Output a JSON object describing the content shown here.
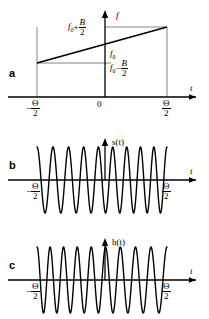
{
  "figure": {
    "panels": [
      {
        "letter": "a",
        "quantity": "frequency-vs-time",
        "y_axis_label": "f",
        "x_axis_label": "t",
        "y_tick_labels": [
          "f₀+B/2",
          "f₀",
          "f₀−B/2"
        ],
        "x_tick_labels": [
          "−Θ/2",
          "0",
          "Θ/2"
        ]
      },
      {
        "letter": "b",
        "quantity": "signal-waveform",
        "y_axis_label": "s(t)",
        "x_axis_label": "t",
        "x_tick_labels": [
          "−Θ/2",
          "Θ/2"
        ]
      },
      {
        "letter": "c",
        "quantity": "impulse-response-waveform",
        "y_axis_label": "h(t)",
        "x_axis_label": "t",
        "x_tick_labels": [
          "−Θ/2",
          "Θ/2"
        ]
      }
    ],
    "symbols": {
      "f0": "f",
      "f0_sub": "0",
      "B": "B",
      "two": "2",
      "theta": "Θ",
      "minus": "−",
      "plus": "+",
      "zero": "0",
      "t": "t",
      "f": "f",
      "s_of_t": "s(t)",
      "h_of_t": "h(t)"
    },
    "colors": {
      "ink": "#000000",
      "guide": "#555555",
      "background": "#ffffff"
    }
  },
  "chart_data": [
    {
      "type": "line",
      "panel": "a",
      "title": "",
      "xlabel": "t",
      "ylabel": "f",
      "xlim": [
        -0.5,
        0.5
      ],
      "ylim": [
        0,
        1
      ],
      "grid": false,
      "legend": "none",
      "x_ticks": [
        -0.5,
        0,
        0.5
      ],
      "x_tick_labels": [
        "−Θ/2",
        "0",
        "Θ/2"
      ],
      "y_ticks": [
        0.28,
        0.5,
        0.72
      ],
      "y_tick_labels": [
        "f₀−B/2",
        "f₀",
        "f₀+B/2"
      ],
      "series": [
        {
          "name": "instantaneous frequency",
          "x": [
            -0.5,
            0.5
          ],
          "values": [
            0.28,
            0.72
          ],
          "description": "linear frequency ramp (chirp) from f0-B/2 to f0+B/2 over duration Theta"
        }
      ],
      "annotations": [
        "vertical guide line at t = -Θ/2",
        "vertical guide line at t = +Θ/2",
        "horizontal guide from f₀+B/2 to the curve at t=+Θ/2",
        "horizontal guide from f₀−B/2 to the curve at t=−Θ/2"
      ]
    },
    {
      "type": "line",
      "panel": "b",
      "title": "",
      "xlabel": "t",
      "ylabel": "s(t)",
      "xlim": [
        -0.5,
        0.5
      ],
      "ylim": [
        -1.15,
        1.15
      ],
      "grid": false,
      "legend": "none",
      "x_ticks": [
        -0.5,
        0.5
      ],
      "x_tick_labels": [
        "−Θ/2",
        "Θ/2"
      ],
      "series": [
        {
          "name": "up-chirp s(t)",
          "description": "cos(2π(f0 t + 0.5 μ t^2)) gated over [-Θ/2, Θ/2]; frequency increases left to right",
          "cycles_total": 9,
          "f_start_cycles_per_half": 4,
          "f_end_cycles_per_half": 5,
          "amplitude": 1.0,
          "chirp_direction": "up"
        }
      ]
    },
    {
      "type": "line",
      "panel": "c",
      "title": "",
      "xlabel": "t",
      "ylabel": "h(t)",
      "xlim": [
        -0.5,
        0.5
      ],
      "ylim": [
        -1.15,
        1.15
      ],
      "grid": false,
      "legend": "none",
      "x_ticks": [
        -0.5,
        0.5
      ],
      "x_tick_labels": [
        "−Θ/2",
        "Θ/2"
      ],
      "series": [
        {
          "name": "down-chirp h(t) = s(-t)",
          "description": "matched filter impulse response, time reversed; frequency decreases left to right",
          "cycles_total": 9,
          "f_start_cycles_per_half": 5,
          "f_end_cycles_per_half": 4,
          "amplitude": 1.0,
          "chirp_direction": "down"
        }
      ]
    }
  ]
}
